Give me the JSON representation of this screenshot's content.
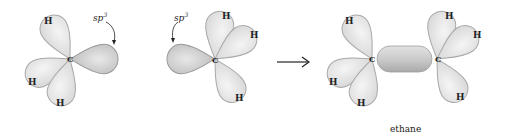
{
  "diagram": {
    "left_carbon": {
      "atom": "C",
      "hydrogens": [
        "H",
        "H",
        "H"
      ],
      "orbital_label": "sp",
      "orbital_superscript": "3"
    },
    "middle_carbon": {
      "atom": "C",
      "hydrogens": [
        "H",
        "H",
        "H"
      ],
      "orbital_label": "sp",
      "orbital_superscript": "3"
    },
    "arrow": "reaction-arrow",
    "product": {
      "left_atom": "C",
      "right_atom": "C",
      "hydrogens_left": [
        "H",
        "H",
        "H"
      ],
      "hydrogens_right": [
        "H",
        "H",
        "H"
      ],
      "caption": "ethane"
    },
    "colors": {
      "lobe_fill": "#e6e6e6",
      "lobe_stroke": "#a8a8a8",
      "sp3_lobe": "#cfcfcf",
      "bond": "#c4c4c4"
    }
  }
}
